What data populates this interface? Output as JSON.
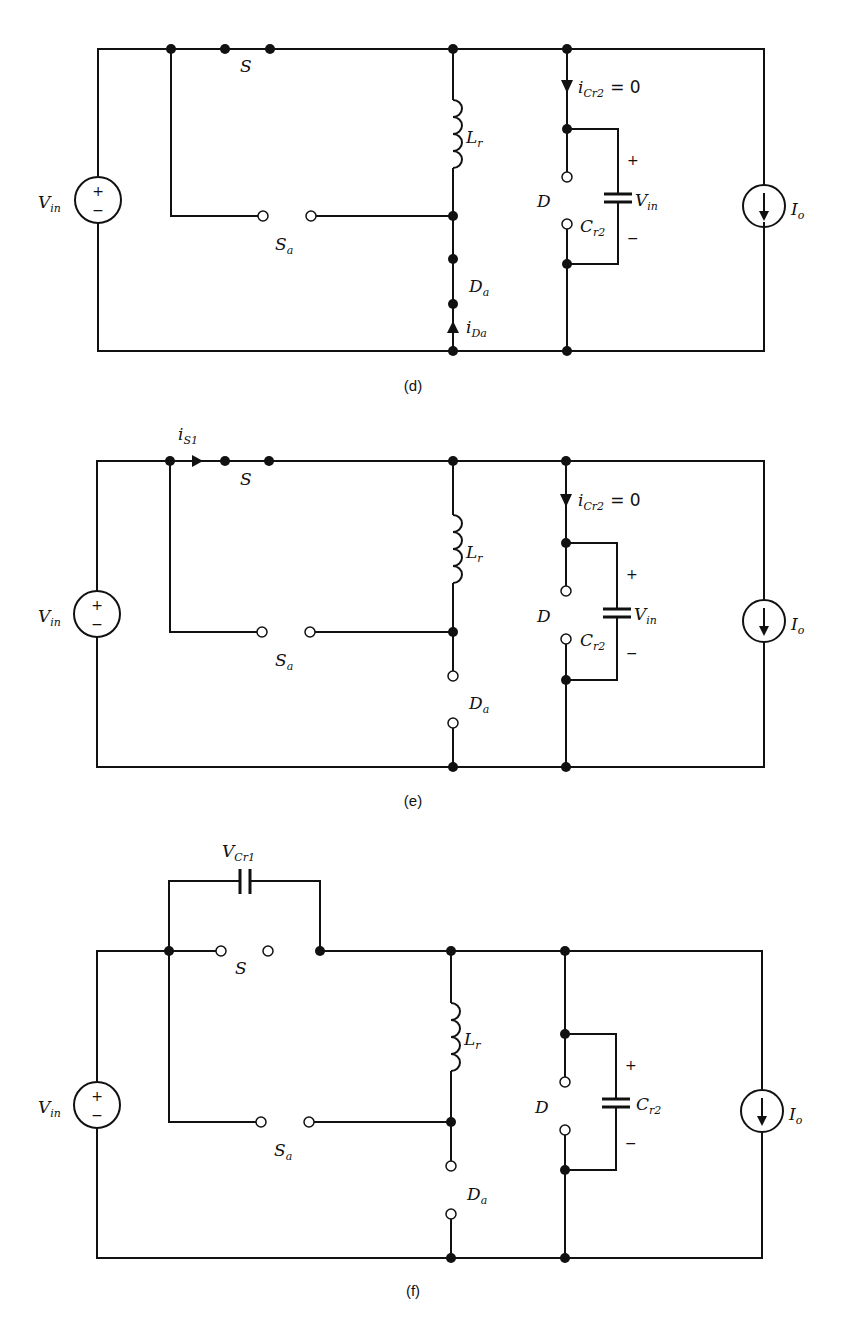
{
  "panels": [
    {
      "id": "d",
      "caption": "(d)",
      "labels": {
        "source": "V",
        "source_sub": "in",
        "switch": "S",
        "aux_switch": "S",
        "aux_switch_sub": "a",
        "inductor": "L",
        "inductor_sub": "r",
        "aux_diode": "D",
        "aux_diode_sub": "a",
        "aux_diode_current": "i",
        "aux_diode_current_sub": "Da",
        "diode": "D",
        "cap_current": "i",
        "cap_current_sub": "Cr2",
        "cap_current_eq": "= 0",
        "cap": "C",
        "cap_sub": "r2",
        "cap_voltage": "V",
        "cap_voltage_sub": "in",
        "plus": "+",
        "minus": "−",
        "load": "I",
        "load_sub": "o"
      },
      "states": {
        "S": "closed",
        "Sa": "open",
        "Da": "closed",
        "D": "open"
      }
    },
    {
      "id": "e",
      "caption": "(e)",
      "labels": {
        "source": "V",
        "source_sub": "in",
        "switch_current": "i",
        "switch_current_sub": "S1",
        "switch": "S",
        "aux_switch": "S",
        "aux_switch_sub": "a",
        "inductor": "L",
        "inductor_sub": "r",
        "aux_diode": "D",
        "aux_diode_sub": "a",
        "diode": "D",
        "cap_current": "i",
        "cap_current_sub": "Cr2",
        "cap_current_eq": "= 0",
        "cap": "C",
        "cap_sub": "r2",
        "cap_voltage": "V",
        "cap_voltage_sub": "in",
        "plus": "+",
        "minus": "−",
        "load": "I",
        "load_sub": "o"
      },
      "states": {
        "S": "closed",
        "Sa": "open",
        "Da": "open",
        "D": "open"
      }
    },
    {
      "id": "f",
      "caption": "(f)",
      "labels": {
        "source": "V",
        "source_sub": "in",
        "snubber_cap": "V",
        "snubber_cap_sub": "Cr1",
        "switch": "S",
        "aux_switch": "S",
        "aux_switch_sub": "a",
        "inductor": "L",
        "inductor_sub": "r",
        "aux_diode": "D",
        "aux_diode_sub": "a",
        "diode": "D",
        "cap": "C",
        "cap_sub": "r2",
        "plus": "+",
        "minus": "−",
        "load": "I",
        "load_sub": "o"
      },
      "states": {
        "S": "open",
        "Sa": "open",
        "Da": "open",
        "D": "open"
      }
    }
  ]
}
